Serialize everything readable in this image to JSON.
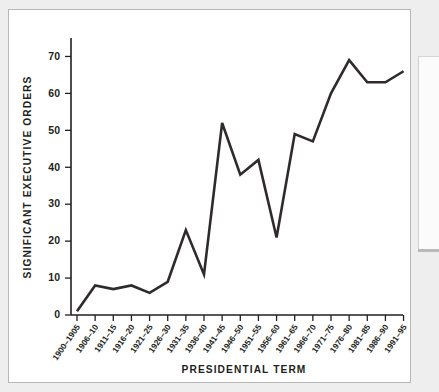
{
  "figure": {
    "background_color": "#ffffff",
    "border_color": "#b7b7b7",
    "page_background": "#eeeeee"
  },
  "chart_data": {
    "type": "line",
    "title": "",
    "xlabel": "PRESIDENTIAL TERM",
    "ylabel": "SIGNIFICANT EXECUTIVE ORDERS",
    "categories": [
      "1900–1905",
      "1906–10",
      "1911–15",
      "1916–20",
      "1921–25",
      "1926–30",
      "1931–35",
      "1936–40",
      "1941–45",
      "1946–50",
      "1951–55",
      "1956–60",
      "1961–65",
      "1966–70",
      "1971–75",
      "1976–80",
      "1981–85",
      "1986–90",
      "1991–95"
    ],
    "values": [
      1,
      8,
      7,
      8,
      6,
      9,
      23,
      11,
      52,
      38,
      42,
      21,
      49,
      47,
      60,
      69,
      63,
      63,
      66
    ],
    "ylim": [
      0,
      75
    ],
    "yticks": [
      0,
      10,
      20,
      30,
      40,
      50,
      60,
      70
    ],
    "ytick_labels": [
      "0",
      "10",
      "20",
      "30",
      "40",
      "50",
      "60",
      "70"
    ],
    "grid": false,
    "legend": false,
    "line_color": "#2f2b2c",
    "axis_color": "#231f20"
  }
}
